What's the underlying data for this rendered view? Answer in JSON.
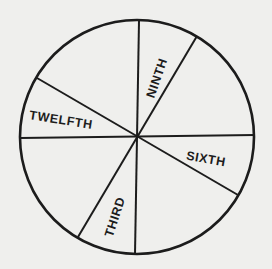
{
  "diagram": {
    "type": "circle-divided-into-sectors",
    "stroke_color": "#1c1c1c",
    "background_color": "#efefed",
    "circle": {
      "cx": 137,
      "cy": 137,
      "r": 117
    },
    "dividers": [
      {
        "name": "divider-vertical",
        "x1": 139,
        "y1": 21,
        "x2": 135,
        "y2": 254
      },
      {
        "name": "divider-horizontal",
        "x1": 20,
        "y1": 138,
        "x2": 255,
        "y2": 135
      },
      {
        "name": "divider-upper-right-lower-left",
        "x1": 197,
        "y1": 36,
        "x2": 78,
        "y2": 237
      },
      {
        "name": "divider-upper-left-lower-right",
        "x1": 37,
        "y1": 78,
        "x2": 238,
        "y2": 195
      }
    ],
    "labels": [
      {
        "text": "NINTH",
        "x": 157,
        "y": 78,
        "rotate": -71
      },
      {
        "text": "TWELFTH",
        "x": 61,
        "y": 120,
        "rotate": 9
      },
      {
        "text": "SIXTH",
        "x": 206,
        "y": 159,
        "rotate": 10
      },
      {
        "text": "THIRD",
        "x": 115,
        "y": 217,
        "rotate": -72
      }
    ]
  }
}
